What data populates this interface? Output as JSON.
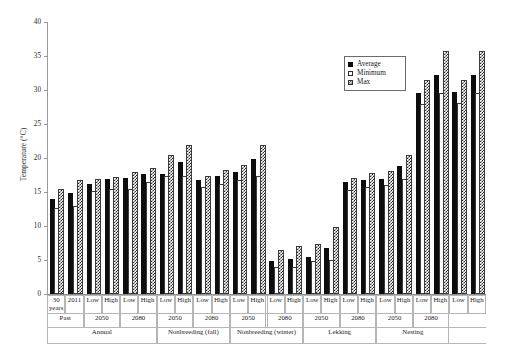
{
  "chart_data": {
    "type": "bar",
    "title": "",
    "xlabel": "",
    "ylabel": "Temperature (°C)",
    "ylim": [
      0,
      40
    ],
    "ytick_step": 5,
    "yticks": [
      0,
      5,
      10,
      15,
      20,
      25,
      30,
      35,
      40
    ],
    "grid": false,
    "legend_position": "top-right",
    "legend": [
      "Average",
      "Minimum",
      "Max"
    ],
    "series": [
      {
        "name": "Average",
        "style": "solid-black",
        "values": [
          14.0,
          14.8,
          16.2,
          16.9,
          17.0,
          17.6,
          17.7,
          19.4,
          16.8,
          17.4,
          17.9,
          19.8,
          4.8,
          5.2,
          5.5,
          6.8,
          16.4,
          16.8,
          16.9,
          18.8,
          29.6,
          32.2,
          29.7,
          32.2
        ]
      },
      {
        "name": "Minimum",
        "style": "open-white",
        "values": [
          12.7,
          13.0,
          15.2,
          15.4,
          15.5,
          16.5,
          17.3,
          17.3,
          15.7,
          16.2,
          16.7,
          17.4,
          4.0,
          4.0,
          4.9,
          5.0,
          15.3,
          15.7,
          16.1,
          16.9,
          28.0,
          29.5,
          28.1,
          29.5
        ]
      },
      {
        "name": "Max",
        "style": "checkered",
        "values": [
          15.5,
          16.7,
          16.9,
          17.2,
          18.0,
          18.5,
          20.4,
          21.9,
          17.4,
          18.2,
          19.0,
          21.9,
          6.4,
          7.0,
          7.3,
          9.9,
          17.0,
          17.8,
          18.1,
          20.4,
          31.5,
          35.8,
          31.5,
          35.8
        ]
      }
    ],
    "categories": [
      "30 years",
      "2011",
      "Low",
      "High",
      "Low",
      "High",
      "Low",
      "High",
      "Low",
      "High",
      "Low",
      "High",
      "Low",
      "High",
      "Low",
      "High",
      "Low",
      "High",
      "Low",
      "High",
      "Low",
      "High",
      "Low",
      "High"
    ],
    "axis_hierarchy": {
      "row1_labels": [
        {
          "label": "30 years",
          "span": 1
        },
        {
          "label": "2011",
          "span": 1
        },
        {
          "label": "Low",
          "span": 1
        },
        {
          "label": "High",
          "span": 1
        },
        {
          "label": "Low",
          "span": 1
        },
        {
          "label": "High",
          "span": 1
        },
        {
          "label": "Low",
          "span": 1
        },
        {
          "label": "High",
          "span": 1
        },
        {
          "label": "Low",
          "span": 1
        },
        {
          "label": "High",
          "span": 1
        },
        {
          "label": "Low",
          "span": 1
        },
        {
          "label": "High",
          "span": 1
        },
        {
          "label": "Low",
          "span": 1
        },
        {
          "label": "High",
          "span": 1
        },
        {
          "label": "Low",
          "span": 1
        },
        {
          "label": "High",
          "span": 1
        },
        {
          "label": "Low",
          "span": 1
        },
        {
          "label": "High",
          "span": 1
        },
        {
          "label": "Low",
          "span": 1
        },
        {
          "label": "High",
          "span": 1
        },
        {
          "label": "Low",
          "span": 1
        },
        {
          "label": "High",
          "span": 1
        },
        {
          "label": "Low",
          "span": 1
        },
        {
          "label": "High",
          "span": 1
        }
      ],
      "row2_labels": [
        {
          "label": "Past",
          "span": 2
        },
        {
          "label": "2050",
          "span": 2
        },
        {
          "label": "2080",
          "span": 2
        },
        {
          "label": "2050",
          "span": 2
        },
        {
          "label": "2080",
          "span": 2
        },
        {
          "label": "2050",
          "span": 2
        },
        {
          "label": "2080",
          "span": 2
        },
        {
          "label": "2050",
          "span": 2
        },
        {
          "label": "2080",
          "span": 2
        },
        {
          "label": "2050",
          "span": 2
        },
        {
          "label": "2080",
          "span": 2
        }
      ],
      "row3_labels": [
        {
          "label": "Annual",
          "span": 6
        },
        {
          "label": "Nonbreeding (fall)",
          "span": 4
        },
        {
          "label": "Nonbreeding (winter)",
          "span": 4
        },
        {
          "label": "Lekking",
          "span": 4
        },
        {
          "label": "Nesting",
          "span": 4
        }
      ]
    },
    "colors": {
      "average": "#0d0d0d",
      "minimum": "#ffffff",
      "max_pattern": "#2e2e2e",
      "axis": "#9a9a9a",
      "text": "#1a1a1a"
    }
  }
}
